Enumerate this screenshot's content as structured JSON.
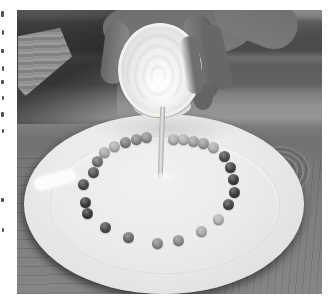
{
  "meta": {
    "style": "black-and-white halftone book print"
  },
  "page": {
    "background": "#ffffff",
    "margin_marks": [
      {
        "x": 1,
        "y": 11,
        "w": 3,
        "h": 6
      },
      {
        "x": 2,
        "y": 30,
        "w": 2,
        "h": 5
      },
      {
        "x": 1,
        "y": 49,
        "w": 3,
        "h": 4
      },
      {
        "x": 2,
        "y": 66,
        "w": 2,
        "h": 5
      },
      {
        "x": 1,
        "y": 80,
        "w": 3,
        "h": 4
      },
      {
        "x": 2,
        "y": 96,
        "w": 2,
        "h": 4
      },
      {
        "x": 1,
        "y": 112,
        "w": 3,
        "h": 5
      },
      {
        "x": 2,
        "y": 129,
        "w": 2,
        "h": 4
      },
      {
        "x": 1,
        "y": 198,
        "w": 3,
        "h": 4
      },
      {
        "x": 2,
        "y": 228,
        "w": 2,
        "h": 4
      }
    ]
  },
  "photo": {
    "frame": {
      "left": 17,
      "top": 10,
      "width": 305,
      "height": 284
    },
    "palette": {
      "wood_dark": "#4d4d4d",
      "wood_mid": "#7a7a7a",
      "wood_light": "#969696",
      "skin": "#747474",
      "cup_body": "#f1f1ef",
      "cup_interior": "#e6e6e4",
      "water_stream": "#d9d9d9",
      "plate_fill": "#ebebe9",
      "plate_edge": "#cfcfcd",
      "plate_highlight": "#fcfcfa"
    },
    "candies": [
      {
        "x": 108,
        "y": 132,
        "shade": "#828282"
      },
      {
        "x": 119,
        "y": 129,
        "shade": "#8a8a8a"
      },
      {
        "x": 129,
        "y": 127,
        "shade": "#909090"
      },
      {
        "x": 156,
        "y": 129,
        "shade": "#b0b0b0"
      },
      {
        "x": 166,
        "y": 129,
        "shade": "#b4b4b4"
      },
      {
        "x": 176,
        "y": 131,
        "shade": "#a2a2a2"
      },
      {
        "x": 186,
        "y": 133,
        "shade": "#9c9c9c"
      },
      {
        "x": 196,
        "y": 137,
        "shade": "#afafaf"
      },
      {
        "x": 207,
        "y": 146,
        "shade": "#4c4c4c"
      },
      {
        "x": 213,
        "y": 157,
        "shade": "#424242"
      },
      {
        "x": 216,
        "y": 169,
        "shade": "#3d3d3d"
      },
      {
        "x": 217,
        "y": 182,
        "shade": "#393939"
      },
      {
        "x": 211,
        "y": 194,
        "shade": "#454545"
      },
      {
        "x": 201,
        "y": 209,
        "shade": "#b4b4b4"
      },
      {
        "x": 184,
        "y": 221,
        "shade": "#a9a9a9"
      },
      {
        "x": 161,
        "y": 230,
        "shade": "#8c8c8c"
      },
      {
        "x": 140,
        "y": 233,
        "shade": "#898989"
      },
      {
        "x": 111,
        "y": 227,
        "shade": "#6b6b6b"
      },
      {
        "x": 88,
        "y": 217,
        "shade": "#4b4b4b"
      },
      {
        "x": 70,
        "y": 203,
        "shade": "#383838"
      },
      {
        "x": 68,
        "y": 192,
        "shade": "#3b3b3b"
      },
      {
        "x": 66,
        "y": 174,
        "shade": "#484848"
      },
      {
        "x": 76,
        "y": 162,
        "shade": "#535353"
      },
      {
        "x": 80,
        "y": 151,
        "shade": "#707070"
      },
      {
        "x": 87,
        "y": 142,
        "shade": "#acacac"
      },
      {
        "x": 97,
        "y": 136,
        "shade": "#b1b1b1"
      }
    ]
  }
}
